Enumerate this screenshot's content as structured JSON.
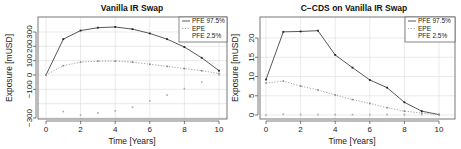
{
  "chart_data": [
    {
      "type": "line",
      "title": "Vanilla IR Swap",
      "xlabel": "Time [Years]",
      "ylabel": "Exposure [mUSD]",
      "xlim": [
        0,
        10
      ],
      "ylim": [
        -300,
        360
      ],
      "xticks": [
        0,
        2,
        4,
        6,
        8,
        10
      ],
      "yticks": [
        -300,
        -100,
        0,
        100,
        200,
        300
      ],
      "ytick_labels": [
        "−300",
        "−100",
        "0",
        "100",
        "200",
        "300"
      ],
      "grid": true,
      "legend_position": "top-right",
      "x": [
        0,
        1,
        2,
        3,
        4,
        5,
        6,
        7,
        8,
        9,
        10
      ],
      "series": [
        {
          "name": "PFE 97.5%",
          "style": "solid",
          "color": "#444444",
          "values": [
            0,
            250,
            310,
            330,
            335,
            320,
            290,
            250,
            195,
            120,
            30
          ]
        },
        {
          "name": "EPE",
          "style": "dotted",
          "color": "#999999",
          "values": [
            0,
            65,
            90,
            97,
            97,
            90,
            75,
            60,
            45,
            30,
            10
          ]
        },
        {
          "name": "PFE 2.5%",
          "style": "points",
          "color": "#aaaaaa",
          "values": [
            0,
            -255,
            -280,
            -265,
            -250,
            -225,
            -180,
            -140,
            -95,
            -50,
            0
          ]
        }
      ]
    },
    {
      "type": "line",
      "title": "C−CDS on Vanilla IR Swap",
      "xlabel": "Time [Years]",
      "ylabel": "Exposure [mUSD]",
      "xlim": [
        0,
        10
      ],
      "ylim": [
        -1,
        25
      ],
      "xticks": [
        0,
        2,
        4,
        6,
        8,
        10
      ],
      "yticks": [
        0,
        5,
        10,
        15,
        20
      ],
      "ytick_labels": [
        "0",
        "5",
        "10",
        "15",
        "20"
      ],
      "grid": true,
      "legend_position": "top-right",
      "x": [
        0,
        1,
        2,
        3,
        4,
        5,
        6,
        7,
        8,
        9,
        10
      ],
      "series": [
        {
          "name": "PFE 97.5%",
          "style": "solid",
          "color": "#444444",
          "values": [
            9.2,
            21.6,
            21.7,
            21.9,
            15.6,
            12.3,
            9.1,
            7.1,
            3.3,
            1.0,
            0.1
          ]
        },
        {
          "name": "EPE",
          "style": "dotted",
          "color": "#999999",
          "values": [
            8.3,
            8.8,
            7.5,
            6.5,
            5.2,
            4.0,
            3.0,
            1.9,
            1.0,
            0.5,
            0.1
          ]
        },
        {
          "name": "PFE 2.5%",
          "style": "points",
          "color": "#aaaaaa",
          "values": [
            0.0,
            0.2,
            0.1,
            0.1,
            0.1,
            0.1,
            0.1,
            0.1,
            0.1,
            0.1,
            0.0
          ]
        }
      ]
    }
  ],
  "charts": [
    {
      "title": "Vanilla IR Swap",
      "xlabel": "Time [Years]",
      "ylabel": "Exposure [mUSD]",
      "legend": [
        "PFE 97.5%",
        "EPE",
        "PFE 2.5%"
      ]
    },
    {
      "title": "C−CDS on Vanilla IR Swap",
      "xlabel": "Time [Years]",
      "ylabel": "Exposure [mUSD]",
      "legend": [
        "PFE 97.5%",
        "EPE",
        "PFE 2.5%"
      ]
    }
  ]
}
